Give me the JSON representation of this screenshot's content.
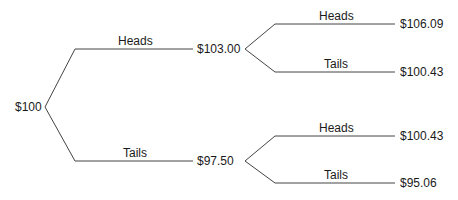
{
  "tree": {
    "root": {
      "value": "$100"
    },
    "level1": [
      {
        "branch": "Heads",
        "value": "$103.00"
      },
      {
        "branch": "Tails",
        "value": "$97.50"
      }
    ],
    "level2": [
      {
        "branch": "Heads",
        "value": "$106.09"
      },
      {
        "branch": "Tails",
        "value": "$100.43"
      },
      {
        "branch": "Heads",
        "value": "$100.43"
      },
      {
        "branch": "Tails",
        "value": "$95.06"
      }
    ]
  },
  "colors": {
    "line": "#444444",
    "text": "#1a1a1a"
  }
}
